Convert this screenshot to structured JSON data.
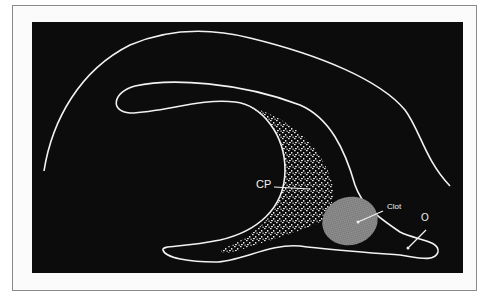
{
  "figure": {
    "type": "anatomical illustration",
    "background_color": "#0c0c0c",
    "outline_color": "#f2f2f2",
    "labels": {
      "choroid_plexus": "CP",
      "clot": "Clot",
      "other": "O"
    },
    "clot_color": "#8c8c8c",
    "stipple_color": "#e8e8e8"
  }
}
